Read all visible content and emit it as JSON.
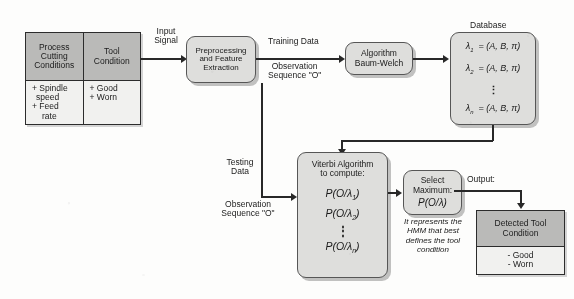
{
  "diagram": {
    "colors": {
      "page_background": "#fbfbfa",
      "box_fill": "#dcdcda",
      "table_header_fill": "#b9b9b7",
      "table_body_fill": "#efefed",
      "line": "#2a2a2a",
      "text": "#1d1d1d"
    }
  },
  "input_table": {
    "columns": [
      {
        "header": [
          "Process",
          "Cutting",
          "Conditions"
        ],
        "items": [
          "+ Spindle",
          "speed",
          "+ Feed",
          "rate"
        ]
      },
      {
        "header": [
          "Tool",
          "Condition"
        ],
        "items": [
          "+ Good",
          "+ Worn"
        ]
      }
    ]
  },
  "preprocessing": {
    "lines": [
      "Preprocessing",
      "and Feature",
      "Extraction"
    ]
  },
  "baum_welch": {
    "lines": [
      "Algorithm",
      "Baum-Welch"
    ]
  },
  "database": {
    "caption": "Database",
    "rows": [
      {
        "lambda": "λ",
        "index": "1",
        "eq": "=",
        "value": "(A, B, π)"
      },
      {
        "lambda": "λ",
        "index": "2",
        "eq": "=",
        "value": "(A, B, π)"
      },
      {
        "lambda": "λ",
        "index": "n",
        "eq": "=",
        "value": "(A, B, π)"
      }
    ],
    "ellipsis": "⋮"
  },
  "viterbi": {
    "header": [
      "Viterbi Algorithm",
      "to compute:"
    ],
    "expressions": [
      {
        "text": "P(O/λ",
        "index": "1",
        "close": ")"
      },
      {
        "text": "P(O/λ",
        "index": "2",
        "close": ")"
      },
      {
        "text": "P(O/λ",
        "index": "n",
        "close": ")"
      }
    ],
    "ellipsis": "⋮"
  },
  "select_maximum": {
    "lines": [
      "Select",
      "Maximum:"
    ],
    "expression": "P(O/λ)",
    "note": [
      "It represents the",
      "HMM that best",
      "defines the tool",
      "condition"
    ]
  },
  "detected_tool_condition": {
    "header": [
      "Detected Tool",
      "Condition"
    ],
    "items": [
      "- Good",
      "- Worn"
    ]
  },
  "edge_labels": {
    "input_signal": [
      "Input",
      "Signal"
    ],
    "training_data": "Training Data",
    "training_observation": [
      "Observation",
      "Sequence \"O\""
    ],
    "testing_data": [
      "Testing",
      "Data"
    ],
    "testing_observation": [
      "Observation",
      "Sequence \"O\""
    ],
    "output": "Output:"
  }
}
